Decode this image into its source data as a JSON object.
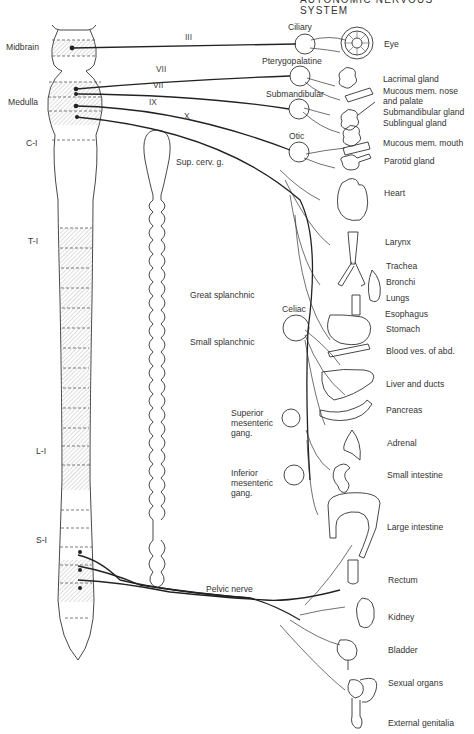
{
  "header": {
    "title": "AUTONOMIC NERVOUS SYSTEM"
  },
  "cns_levels": [
    {
      "id": "midbrain",
      "label": "Midbrain"
    },
    {
      "id": "medulla",
      "label": "Medulla"
    },
    {
      "id": "c1",
      "label": "C-I"
    },
    {
      "id": "t1",
      "label": "T-I"
    },
    {
      "id": "l1",
      "label": "L-I"
    },
    {
      "id": "s1",
      "label": "S-I"
    }
  ],
  "cranial_nerves": [
    {
      "id": "III",
      "label": "III"
    },
    {
      "id": "VII_a",
      "label": "VII"
    },
    {
      "id": "VII_b",
      "label": "VII"
    },
    {
      "id": "IX",
      "label": "IX"
    },
    {
      "id": "X",
      "label": "X"
    }
  ],
  "ganglia": [
    {
      "id": "ciliary",
      "label": "Ciliary"
    },
    {
      "id": "pterygopalatine",
      "label": "Pterygopalatine"
    },
    {
      "id": "submandibular",
      "label": "Submandibular"
    },
    {
      "id": "otic",
      "label": "Otic"
    },
    {
      "id": "sup_cerv",
      "label": "Sup. cerv. g."
    },
    {
      "id": "celiac",
      "label": "Celiac"
    },
    {
      "id": "sup_mesenteric",
      "label": "Superior mesenteric gang."
    },
    {
      "id": "inf_mesenteric",
      "label": "Inferior mesenteric gang."
    }
  ],
  "sympathetic_nerves": [
    {
      "id": "great_splanchnic",
      "label": "Great splanchnic"
    },
    {
      "id": "small_splanchnic",
      "label": "Small splanchnic"
    },
    {
      "id": "pelvic_nerve",
      "label": "Pelvic nerve"
    }
  ],
  "organs": [
    {
      "id": "eye",
      "label": "Eye"
    },
    {
      "id": "lacrimal",
      "label": "Lacrimal gland"
    },
    {
      "id": "mucous_nose",
      "label": "Mucous mem. nose and palate"
    },
    {
      "id": "submandibular_gland",
      "label": "Submandibular gland"
    },
    {
      "id": "sublingual",
      "label": "Sublingual gland"
    },
    {
      "id": "mucous_mouth",
      "label": "Mucous mem. mouth"
    },
    {
      "id": "parotid",
      "label": "Parotid gland"
    },
    {
      "id": "heart",
      "label": "Heart"
    },
    {
      "id": "larynx",
      "label": "Larynx"
    },
    {
      "id": "trachea",
      "label": "Trachea"
    },
    {
      "id": "bronchi",
      "label": "Bronchi"
    },
    {
      "id": "lungs",
      "label": "Lungs"
    },
    {
      "id": "esophagus",
      "label": "Esophagus"
    },
    {
      "id": "stomach",
      "label": "Stomach"
    },
    {
      "id": "blood_ves",
      "label": "Blood ves. of abd."
    },
    {
      "id": "liver",
      "label": "Liver and ducts"
    },
    {
      "id": "pancreas",
      "label": "Pancreas"
    },
    {
      "id": "adrenal",
      "label": "Adrenal"
    },
    {
      "id": "small_intestine",
      "label": "Small intestine"
    },
    {
      "id": "large_intestine",
      "label": "Large intestine"
    },
    {
      "id": "rectum",
      "label": "Rectum"
    },
    {
      "id": "kidney",
      "label": "Kidney"
    },
    {
      "id": "bladder",
      "label": "Bladder"
    },
    {
      "id": "sexual_organs",
      "label": "Sexual organs"
    },
    {
      "id": "external_genitalia",
      "label": "External genitalia"
    }
  ],
  "colors": {
    "line": "#2a2a2a",
    "hatch": "#9a9a9a",
    "background": "#ffffff"
  }
}
